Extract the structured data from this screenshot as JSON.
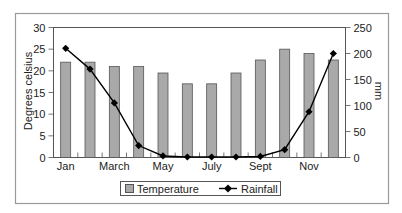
{
  "chart_data": {
    "type": "bar+line",
    "title": "",
    "categories": [
      "Jan",
      "Feb",
      "Mar",
      "Apr",
      "May",
      "Jun",
      "Jul",
      "Aug",
      "Sep",
      "Oct",
      "Nov",
      "Dec"
    ],
    "x_tick_labels": [
      {
        "index": 0,
        "label": "Jan"
      },
      {
        "index": 2,
        "label": "March"
      },
      {
        "index": 4,
        "label": "May"
      },
      {
        "index": 6,
        "label": "July"
      },
      {
        "index": 8,
        "label": "Sept"
      },
      {
        "index": 10,
        "label": "Nov"
      }
    ],
    "series": [
      {
        "name": "Temperature",
        "type": "bar",
        "axis": "left",
        "values": [
          22,
          22,
          21,
          21,
          19.5,
          17,
          17,
          19.5,
          22.5,
          25,
          24,
          22.5
        ],
        "fill": "#a9a9a9",
        "stroke": "#555555"
      },
      {
        "name": "Rainfall",
        "type": "line",
        "axis": "right",
        "marker": "diamond",
        "values": [
          210,
          170,
          105,
          23,
          3,
          1,
          1,
          1,
          2,
          15,
          88,
          200
        ],
        "color": "#000000"
      }
    ],
    "left_axis": {
      "label": "Degrees celsius",
      "min": 0,
      "max": 30,
      "ticks": [
        0,
        5,
        10,
        15,
        20,
        25,
        30
      ]
    },
    "right_axis": {
      "label": "mm",
      "min": 0,
      "max": 250,
      "ticks": [
        0,
        50,
        100,
        150,
        200,
        250
      ]
    },
    "xlabel": "",
    "grid": false,
    "legend": {
      "position": "bottom",
      "entries": [
        "Temperature",
        "Rainfall"
      ]
    }
  }
}
